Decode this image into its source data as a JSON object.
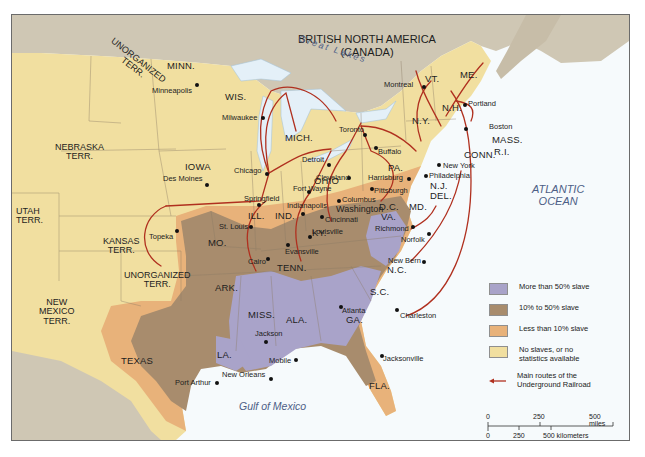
{
  "map": {
    "region_label": {
      "line1": "BRITISH NORTH AMERICA",
      "line2": "(CANADA)"
    },
    "water_labels": {
      "great_lakes": "Great Lakes",
      "atlantic_line1": "ATLANTIC",
      "atlantic_line2": "OCEAN",
      "gulf": "Gulf of Mexico"
    },
    "territories": [
      {
        "id": "unorganized-north",
        "line1": "UNORGANIZED",
        "line2": "TERR."
      },
      {
        "id": "nebraska",
        "line1": "NEBRASKA",
        "line2": "TERR."
      },
      {
        "id": "utah",
        "line1": "UTAH",
        "line2": "TERR."
      },
      {
        "id": "kansas",
        "line1": "KANSAS",
        "line2": "TERR."
      },
      {
        "id": "unorganized-south",
        "line1": "UNORGANIZED",
        "line2": "TERR."
      },
      {
        "id": "new-mexico",
        "line1": "NEW",
        "line2": "MEXICO",
        "line3": "TERR."
      }
    ],
    "states": [
      "MINN.",
      "WIS.",
      "IOWA",
      "MICH.",
      "ILL.",
      "IND.",
      "OHIO",
      "MO.",
      "KY.",
      "TENN.",
      "ARK.",
      "MISS.",
      "ALA.",
      "GA.",
      "S.C.",
      "N.C.",
      "VA.",
      "MD.",
      "DEL.",
      "N.J.",
      "PA.",
      "N.Y.",
      "VT.",
      "N.H.",
      "ME.",
      "MASS.",
      "R.I.",
      "CONN.",
      "LA.",
      "TEXAS",
      "FLA.",
      "D.C."
    ],
    "cities": [
      "Minneapolis",
      "Milwaukee",
      "Chicago",
      "Des Moines",
      "Topeka",
      "St. Louis",
      "Springfield",
      "Cairo",
      "Indianapolis",
      "Fort Wayne",
      "Evansville",
      "Louisville",
      "Cincinnati",
      "Columbus",
      "Cleveland",
      "Detroit",
      "Toronto",
      "Buffalo",
      "Montreal",
      "Portland",
      "Boston",
      "New York",
      "Philadelphia",
      "Harrisburg",
      "Pittsburgh",
      "Washington",
      "Richmond",
      "Norfolk",
      "New Bern",
      "Charleston",
      "Atlanta",
      "Jacksonville",
      "Mobile",
      "Jackson",
      "New Orleans",
      "Port Arthur"
    ]
  },
  "legend": {
    "items": [
      {
        "label": "More than 50% slave",
        "color": "#a9a3c9"
      },
      {
        "label": "10% to 50% slave",
        "color": "#a88c6d"
      },
      {
        "label": "Less than 10% slave",
        "color": "#e8b27a"
      },
      {
        "label_line1": "No slaves, or no",
        "label_line2": "statistics available",
        "color": "#f1dfa0"
      },
      {
        "label_line1": "Main routes of the",
        "label_line2": "Underground Railroad",
        "color": "#b0301f"
      }
    ]
  },
  "scale": {
    "miles": [
      "0",
      "250",
      "500 miles"
    ],
    "km": [
      "0",
      "250",
      "500 kilometers"
    ]
  },
  "colors": {
    "canada": "#cfc7b4",
    "free": "#f1dfa0",
    "low": "#e8b27a",
    "mid": "#a88c6d",
    "high": "#a9a3c9",
    "water": "#f4f9fc",
    "lakes": "#e4f0f8",
    "route": "#b0301f"
  }
}
